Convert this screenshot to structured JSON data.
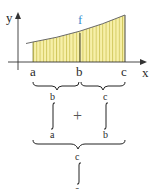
{
  "diagram": {
    "axes": {
      "x_label": "x",
      "y_label": "y"
    },
    "points": {
      "a": "a",
      "b": "b",
      "c": "c"
    },
    "function_label": "f",
    "colors": {
      "fill": "#f7f0a8",
      "hatch": "#c9bd4a",
      "curve": "#6a6a6a",
      "function_label": "#3b8fd0",
      "axis": "#333333"
    },
    "integral_left": {
      "upper": "b",
      "lower": "a"
    },
    "operator": "+",
    "integral_right": {
      "upper": "c",
      "lower": "b"
    },
    "integral_combined": {
      "upper": "c",
      "lower": "a"
    }
  }
}
